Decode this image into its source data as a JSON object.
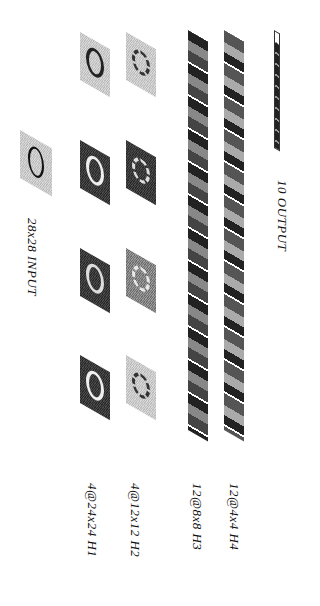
{
  "diagram": {
    "orientation": "rotated-90-clockwise",
    "layers": [
      {
        "id": "input",
        "label": "28x28 INPUT",
        "maps": 1
      },
      {
        "id": "h1",
        "label": "4@24x24 H1",
        "maps": 4
      },
      {
        "id": "h2",
        "label": "4@12x12 H2",
        "maps": 4
      },
      {
        "id": "h3",
        "label": "12@8x8 H3",
        "maps": 12
      },
      {
        "id": "h4",
        "label": "12@4x4 H4",
        "maps": 12
      },
      {
        "id": "output",
        "label": "10 OUTPUT",
        "units": 10
      }
    ]
  }
}
